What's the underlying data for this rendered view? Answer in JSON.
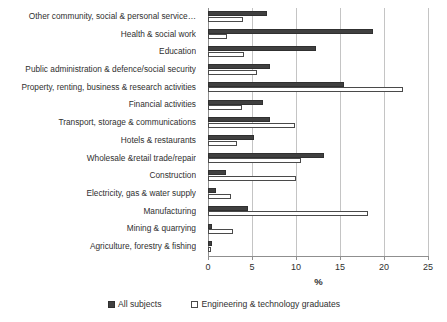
{
  "chart_data": {
    "type": "bar",
    "orientation": "horizontal",
    "title": "",
    "xlabel": "%",
    "ylabel": "",
    "xlim": [
      0,
      25
    ],
    "xticks": [
      0,
      5,
      10,
      15,
      20,
      25
    ],
    "xtick_labels": [
      "0",
      "5",
      "10",
      "15",
      "20",
      "25"
    ],
    "grid": true,
    "legend_position": "bottom",
    "categories": [
      "Other community, social & personal service…",
      "Health & social work",
      "Education",
      "Public administration & defence/social security",
      "Property, renting, business & research activities",
      "Financial activities",
      "Transport, storage & communications",
      "Hotels & restaurants",
      "Wholesale &retail trade/repair",
      "Construction",
      "Electricity, gas & water supply",
      "Manufacturing",
      "Mining & quarrying",
      "Agriculture, forestry & fishing"
    ],
    "series": [
      {
        "name": "All subjects",
        "color": "#404040",
        "style": "filled",
        "values": [
          6.7,
          18.8,
          12.3,
          7.1,
          15.4,
          6.3,
          7.1,
          5.2,
          13.2,
          2.1,
          0.9,
          4.5,
          0.5,
          0.4
        ]
      },
      {
        "name": "Engineering & technology graduates",
        "color": "#ffffff",
        "style": "outlined",
        "values": [
          4.0,
          2.2,
          4.1,
          5.6,
          22.2,
          3.9,
          9.9,
          3.3,
          10.6,
          10.0,
          2.6,
          18.2,
          2.8,
          0.3
        ]
      }
    ]
  },
  "legend": {
    "items": [
      {
        "label": "All subjects",
        "swatch": "dark"
      },
      {
        "label": "Engineering & technology graduates",
        "swatch": "light"
      }
    ]
  }
}
